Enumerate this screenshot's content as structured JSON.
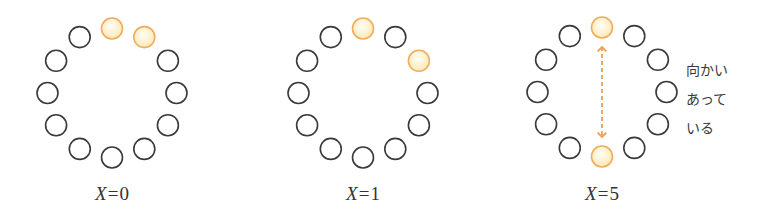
{
  "diagram": {
    "colors": {
      "seat_stroke": "#3a3a3a",
      "highlight_stroke": "#f0ad5c",
      "highlight_fill_inner": "#fffdf5",
      "highlight_fill_outer": "#fde9b8",
      "arrow": "#f0a050",
      "text": "#333333"
    },
    "seat_count": 12,
    "panels": [
      {
        "id": "x0",
        "center": [
          112,
          93
        ],
        "highlighted_positions": [
          0,
          1
        ],
        "label": {
          "var": "X",
          "eq": "=",
          "value": "0"
        },
        "arrow": false
      },
      {
        "id": "x1",
        "center": [
          363,
          93
        ],
        "highlighted_positions": [
          0,
          2
        ],
        "label": {
          "var": "X",
          "eq": "=",
          "value": "1"
        },
        "arrow": false
      },
      {
        "id": "x5",
        "center": [
          602,
          92
        ],
        "highlighted_positions": [
          0,
          6
        ],
        "label": {
          "var": "X",
          "eq": "=",
          "value": "5"
        },
        "arrow": true
      }
    ],
    "note": {
      "lines": [
        "向かい",
        "あって",
        "いる"
      ]
    }
  }
}
